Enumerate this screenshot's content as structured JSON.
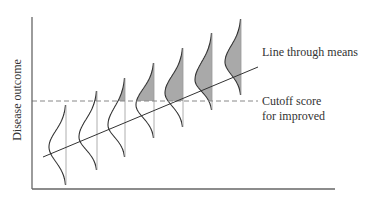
{
  "diagram": {
    "y_axis_label": "Disease outcome",
    "annotations": {
      "mean_line": "Line through means",
      "cutoff_line_1": "Cutoff score",
      "cutoff_line_2": "for improved"
    },
    "axis": {
      "x0": 32,
      "y_top": 17,
      "y_bottom": 189,
      "x_end": 335
    },
    "cutoff_y": 101,
    "mean_line": {
      "x1": 43,
      "y1": 157,
      "x2": 258,
      "y2": 67
    },
    "colors": {
      "axis": "#666666",
      "curve": "#333333",
      "fill": "#a9a9a9",
      "dash": "#888888",
      "text": "#333333"
    },
    "distributions": [
      {
        "base_x": 66,
        "top": 105,
        "bottom": 185,
        "peak_x": 49,
        "peak_y": 147
      },
      {
        "base_x": 97,
        "top": 91,
        "bottom": 170,
        "peak_x": 79,
        "peak_y": 137
      },
      {
        "base_x": 125,
        "top": 78,
        "bottom": 157,
        "peak_x": 108,
        "peak_y": 125
      },
      {
        "base_x": 154,
        "top": 63,
        "bottom": 138,
        "peak_x": 136,
        "peak_y": 105
      },
      {
        "base_x": 183,
        "top": 48,
        "bottom": 127,
        "peak_x": 165,
        "peak_y": 93
      },
      {
        "base_x": 212,
        "top": 33,
        "bottom": 110,
        "peak_x": 195,
        "peak_y": 80
      },
      {
        "base_x": 241,
        "top": 19,
        "bottom": 95,
        "peak_x": 225,
        "peak_y": 62
      }
    ]
  }
}
